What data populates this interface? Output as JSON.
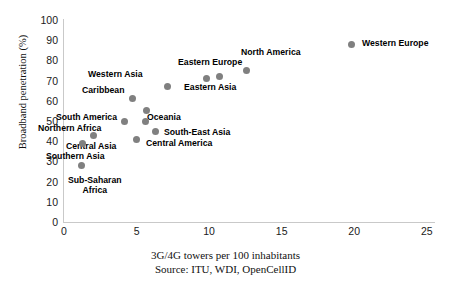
{
  "chart_data": {
    "type": "scatter",
    "title": "",
    "xlabel": "3G/4G towers per 100 inhabitants",
    "ylabel": "Broadband penetration (%)",
    "source": "Source: ITU, WDI, OpenCellID",
    "xlim": [
      0,
      25.5
    ],
    "ylim": [
      0,
      100
    ],
    "xticks": [
      "0",
      "5",
      "10",
      "15",
      "20",
      "25"
    ],
    "xtick_values": [
      0,
      5,
      10,
      15,
      20,
      25
    ],
    "yticks": [
      "0",
      "10",
      "20",
      "30",
      "40",
      "50",
      "60",
      "70",
      "80",
      "90",
      "100"
    ],
    "ytick_values": [
      0,
      10,
      20,
      30,
      40,
      50,
      60,
      70,
      80,
      90,
      100
    ],
    "grid": false,
    "legend": "none",
    "marker_color": "#808080",
    "axis_color": "#c9c9c9",
    "points": [
      {
        "name": "Sub-Saharan Africa",
        "x": 1.2,
        "y": 28,
        "label_lines": [
          "Sub-Saharan",
          "Africa"
        ],
        "label_x": 68,
        "label_y": 176
      },
      {
        "name": "Southern Asia",
        "x": 1.3,
        "y": 39,
        "label_lines": [
          "Southern Asia"
        ],
        "label_x": 46,
        "label_y": 152
      },
      {
        "name": "Central Asia",
        "x": 2.0,
        "y": 43,
        "label_lines": [
          "Central Asia"
        ],
        "label_x": 66,
        "label_y": 142
      },
      {
        "name": "Northern Africa",
        "x": 4.2,
        "y": 50,
        "label_lines": [
          "Northern Africa"
        ],
        "label_x": 38,
        "label_y": 124
      },
      {
        "name": "South America",
        "x": 5.7,
        "y": 55,
        "label_lines": [
          "South America"
        ],
        "label_x": 56,
        "label_y": 113
      },
      {
        "name": "Caribbean",
        "x": 4.7,
        "y": 61,
        "label_lines": [
          "Caribbean"
        ],
        "label_x": 82,
        "label_y": 86
      },
      {
        "name": "Oceania",
        "x": 5.6,
        "y": 50,
        "label_lines": [
          "Oceania"
        ],
        "label_x": 147,
        "label_y": 113
      },
      {
        "name": "South-East Asia",
        "x": 6.3,
        "y": 45,
        "label_lines": [
          "South-East Asia"
        ],
        "label_x": 164,
        "label_y": 128
      },
      {
        "name": "Central America",
        "x": 5.0,
        "y": 41,
        "label_lines": [
          "Central America"
        ],
        "label_x": 146,
        "label_y": 139
      },
      {
        "name": "Western Asia",
        "x": 7.1,
        "y": 67,
        "label_lines": [
          "Western Asia"
        ],
        "label_x": 88,
        "label_y": 70
      },
      {
        "name": "Eastern Asia",
        "x": 9.8,
        "y": 71,
        "label_lines": [
          "Eastern Asia"
        ],
        "label_x": 184,
        "label_y": 83
      },
      {
        "name": "Eastern Europe",
        "x": 10.7,
        "y": 72,
        "label_lines": [
          "Eastern Europe"
        ],
        "label_x": 178,
        "label_y": 58
      },
      {
        "name": "North America",
        "x": 12.6,
        "y": 75,
        "label_lines": [
          "North America"
        ],
        "label_x": 241,
        "label_y": 48
      },
      {
        "name": "Western Europe",
        "x": 19.8,
        "y": 88,
        "label_lines": [
          "Western Europe"
        ],
        "label_x": 362,
        "label_y": 39
      }
    ]
  }
}
